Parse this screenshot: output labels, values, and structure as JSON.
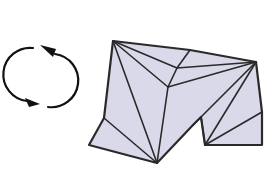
{
  "diagram": {
    "title": "",
    "colors": {
      "background": "#ffffff",
      "paper_fill": "#d9d9ea",
      "line": "#2a2a2a",
      "arrow": "#111111"
    },
    "icons": [
      {
        "name": "rotate-arrows-icon",
        "meaning": "turn model over / rotate"
      }
    ],
    "model": {
      "vertices": {
        "A": [
          113,
          41
        ],
        "N": [
          190,
          50
        ],
        "C": [
          256,
          62
        ],
        "D": [
          262,
          112
        ],
        "E": [
          262,
          145
        ],
        "F": [
          205,
          145
        ],
        "G": [
          201,
          117
        ],
        "H": [
          193,
          125
        ],
        "I": [
          157,
          163
        ],
        "J": [
          89,
          145
        ],
        "K": [
          104,
          118
        ],
        "M": [
          168,
          87
        ],
        "P": [
          177,
          68
        ]
      },
      "outline": [
        "A",
        "N",
        "C",
        "D",
        "E",
        "F",
        "G",
        "H",
        "I",
        "J",
        "K"
      ],
      "creases": [
        [
          "A",
          "I"
        ],
        [
          "K",
          "I"
        ],
        [
          "A",
          "M"
        ],
        [
          "M",
          "I"
        ],
        [
          "A",
          "P"
        ],
        [
          "P",
          "M"
        ],
        [
          "P",
          "N"
        ],
        [
          "P",
          "C"
        ],
        [
          "M",
          "C"
        ],
        [
          "C",
          "H"
        ],
        [
          "C",
          "F"
        ],
        [
          "G",
          "F"
        ],
        [
          "D",
          "F"
        ]
      ]
    }
  }
}
